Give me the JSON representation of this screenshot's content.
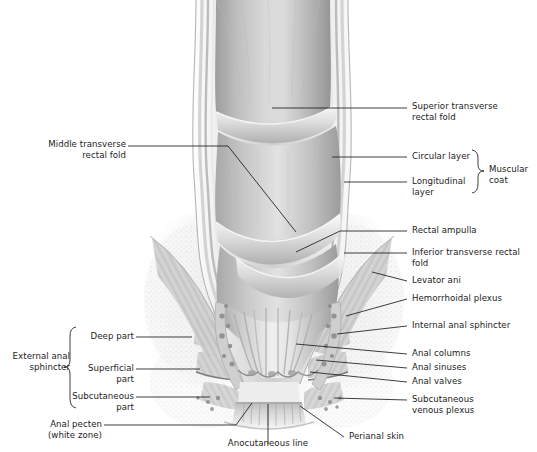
{
  "figure": {
    "style": "grayscale medical illustration",
    "colors": {
      "background": "#ffffff",
      "leader_line": "#1c1c1c",
      "text": "#1c1c1c",
      "tissue_light": "#f2f2f2",
      "tissue_mid": "#c9c9c9",
      "tissue_dark": "#8e8e8e",
      "lumen_shadow": "#a5a5a5"
    }
  },
  "labels_right": [
    {
      "id": "superior-transverse-rectal-fold",
      "text": "Superior transverse\nrectal fold"
    },
    {
      "id": "circular-layer",
      "text": "Circular layer"
    },
    {
      "id": "longitudinal-layer",
      "text": "Longitudinal\nlayer"
    },
    {
      "id": "muscular-coat",
      "text": "Muscular\ncoat"
    },
    {
      "id": "rectal-ampulla",
      "text": "Rectal ampulla"
    },
    {
      "id": "inferior-transverse-rectal-fold",
      "text": "Inferior transverse rectal fold"
    },
    {
      "id": "levator-ani",
      "text": "Levator ani"
    },
    {
      "id": "hemorrhoidal-plexus",
      "text": "Hemorrhoidal plexus"
    },
    {
      "id": "internal-anal-sphincter",
      "text": "Internal anal sphincter"
    },
    {
      "id": "anal-columns",
      "text": "Anal columns"
    },
    {
      "id": "anal-sinuses",
      "text": "Anal sinuses"
    },
    {
      "id": "anal-valves",
      "text": "Anal valves"
    },
    {
      "id": "subcutaneous-venous-plexus",
      "text": "Subcutaneous\nvenous plexus"
    }
  ],
  "labels_left": [
    {
      "id": "middle-transverse-rectal-fold",
      "text": "Middle transverse\nrectal fold"
    },
    {
      "id": "external-anal-sphincter",
      "text": "External anal\nsphincter"
    },
    {
      "id": "deep-part",
      "text": "Deep part"
    },
    {
      "id": "superficial-part",
      "text": "Superficial\npart"
    },
    {
      "id": "subcutaneous-part",
      "text": "Subcutaneous\npart"
    },
    {
      "id": "anal-pecten",
      "text": "Anal pecten\n(white zone)"
    }
  ],
  "labels_bottom": [
    {
      "id": "anocutaneous-line",
      "text": "Anocutaneous line"
    },
    {
      "id": "perianal-skin",
      "text": "Perianal skin"
    }
  ]
}
